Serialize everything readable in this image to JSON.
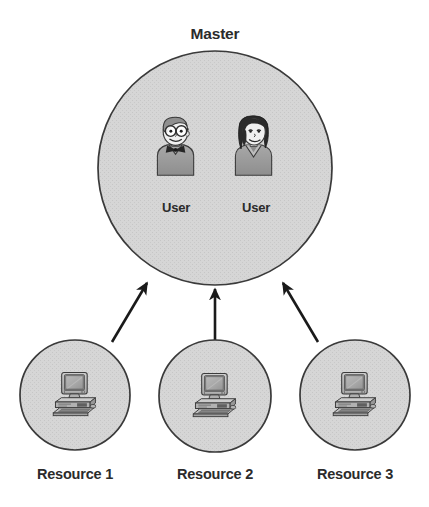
{
  "diagram": {
    "type": "master-resource-domain-model",
    "background_color": "#ffffff",
    "circle_fill_color": "#d4d4d4",
    "circle_stroke_color": "#3a3a3a",
    "arrow_color": "#1a1a1a",
    "text_color": "#2b2b2b",
    "master": {
      "title": "Master",
      "shape": "circle",
      "center_x": 215,
      "center_y": 168,
      "diameter": 234,
      "users": [
        {
          "label": "User",
          "icon": "user-male-glasses-bowtie-icon",
          "center_x": 176,
          "center_y": 157
        },
        {
          "label": "User",
          "icon": "user-female-icon",
          "center_x": 254,
          "center_y": 157
        }
      ]
    },
    "resources": [
      {
        "label": "Resource 1",
        "icon": "desktop-computer-icon",
        "shape": "circle",
        "center_x": 75,
        "center_y": 395,
        "diameter": 110
      },
      {
        "label": "Resource 2",
        "icon": "desktop-computer-icon",
        "shape": "circle",
        "center_x": 215,
        "center_y": 396,
        "diameter": 112
      },
      {
        "label": "Resource 3",
        "icon": "desktop-computer-icon",
        "shape": "circle",
        "center_x": 355,
        "center_y": 395,
        "diameter": 110
      }
    ],
    "arrows": [
      {
        "name": "trust-arrow-resource-1-to-master",
        "from": "Resource 1",
        "to": "Master",
        "direction": "up-right",
        "x1": 112,
        "y1": 342,
        "x2": 146,
        "y2": 282
      },
      {
        "name": "trust-arrow-resource-2-to-master",
        "from": "Resource 2",
        "to": "Master",
        "direction": "up",
        "x1": 215,
        "y1": 340,
        "x2": 215,
        "y2": 288
      },
      {
        "name": "trust-arrow-resource-3-to-master",
        "from": "Resource 3",
        "to": "Master",
        "direction": "up-left",
        "x1": 318,
        "y1": 342,
        "x2": 284,
        "y2": 282
      }
    ]
  }
}
